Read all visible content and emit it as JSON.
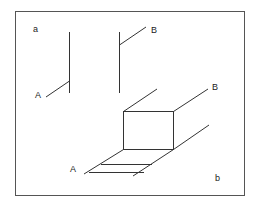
{
  "figure": {
    "panels": [
      {
        "id": "a",
        "label": "a",
        "description": "Two vertical lines each with a short diagonal branch; A at lower branch, B at upper branch"
      },
      {
        "id": "b",
        "label": "b",
        "description": "Perspective box with floor strip extending from A to B"
      }
    ],
    "labels": {
      "panel_a": "a",
      "panel_b": "b",
      "a_point_A": "A",
      "a_point_B": "B",
      "b_point_A": "A",
      "b_point_B": "B"
    },
    "colors": {
      "stroke": "#333333",
      "border": "#555555",
      "background": "#ffffff"
    }
  }
}
